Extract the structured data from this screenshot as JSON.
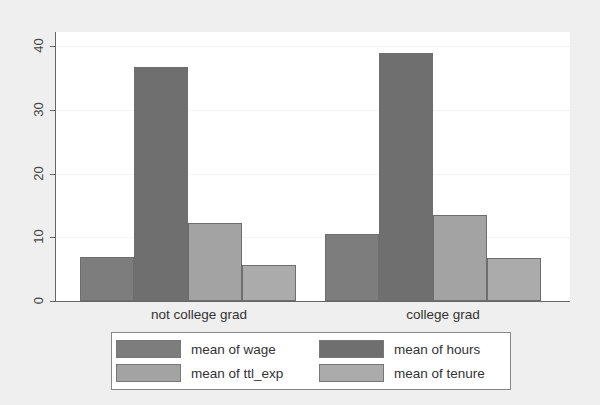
{
  "chart_data": {
    "type": "bar",
    "title": "",
    "xlabel": "",
    "ylabel": "",
    "categories": [
      "not college grad",
      "college grad"
    ],
    "series": [
      {
        "name": "mean of wage",
        "values": [
          6.9,
          10.5
        ],
        "color": "#7d7d7d"
      },
      {
        "name": "mean of hours",
        "values": [
          36.7,
          38.9
        ],
        "color": "#6f6f6f"
      },
      {
        "name": "mean of ttl_exp",
        "values": [
          12.2,
          13.5
        ],
        "color": "#a3a3a3"
      },
      {
        "name": "mean of tenure",
        "values": [
          5.6,
          6.7
        ],
        "color": "#ababab"
      }
    ],
    "ylim": [
      0,
      42
    ],
    "yticks": [
      "0",
      "10",
      "20",
      "30",
      "40"
    ],
    "grid": false,
    "legend_position": "bottom"
  },
  "legend": {
    "items": [
      {
        "label": "mean of wage",
        "color": "#7d7d7d"
      },
      {
        "label": "mean of hours",
        "color": "#6f6f6f"
      },
      {
        "label": "mean of ttl_exp",
        "color": "#a3a3a3"
      },
      {
        "label": "mean of tenure",
        "color": "#ababab"
      }
    ]
  }
}
